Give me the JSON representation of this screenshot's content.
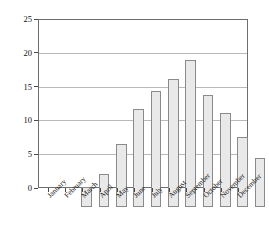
{
  "chart_data": {
    "type": "bar",
    "title": "",
    "subtitle": "",
    "xlabel": "",
    "ylabel": "Evaporation (cm)",
    "categories": [
      "January",
      "February",
      "March",
      "April",
      "May",
      "June",
      "July",
      "August",
      "September",
      "October",
      "November",
      "December"
    ],
    "values": [
      3.0,
      5.0,
      9.5,
      14.6,
      17.4,
      19.1,
      22.0,
      16.7,
      14.0,
      10.5,
      7.4,
      5.5
    ],
    "ylim": [
      0,
      25
    ],
    "yticks": [
      0,
      5,
      10,
      15,
      20,
      25
    ],
    "ytick_labels": [
      "0",
      "5",
      "10",
      "15",
      "20",
      "25"
    ],
    "grid": true,
    "grid_axis": "y",
    "legend": false,
    "legend_position": "none",
    "bar_fill_color": "#e9e9e9",
    "bar_edge_color": "#8a8a8a",
    "gridline_color": "#b9b9b9",
    "frame_color": "#6e6e6e",
    "text_color": "#111111",
    "background_color": "#ffffff"
  },
  "axes": {
    "y_title": "Evaporation (cm)"
  }
}
